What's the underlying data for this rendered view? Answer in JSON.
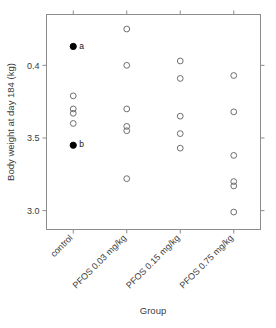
{
  "chart_data": {
    "type": "scatter",
    "title": "",
    "xlabel": "Group",
    "ylabel": "Body weight at day 184 (kg)",
    "categories": [
      "control",
      "PFOS 0.03 mg/kg",
      "PFOS 0.15 mg/kg",
      "PFOS 0.75 mg/kg"
    ],
    "ytick_labels": [
      "3.0",
      "3.5",
      "0.4"
    ],
    "ytick_values": [
      3.0,
      3.5,
      4.0
    ],
    "ylim": [
      2.87,
      4.35
    ],
    "grid": false,
    "legend": "none",
    "marker": "open-circle",
    "series": [
      {
        "name": "control",
        "category_index": 0,
        "points": [
          {
            "value": 4.13,
            "filled": true,
            "label": "a"
          },
          {
            "value": 3.79,
            "filled": false,
            "label": ""
          },
          {
            "value": 3.7,
            "filled": false,
            "label": ""
          },
          {
            "value": 3.67,
            "filled": false,
            "label": ""
          },
          {
            "value": 3.6,
            "filled": false,
            "label": ""
          },
          {
            "value": 3.45,
            "filled": true,
            "label": "b"
          }
        ]
      },
      {
        "name": "PFOS 0.03 mg/kg",
        "category_index": 1,
        "points": [
          {
            "value": 4.25,
            "filled": false,
            "label": ""
          },
          {
            "value": 4.0,
            "filled": false,
            "label": ""
          },
          {
            "value": 3.7,
            "filled": false,
            "label": ""
          },
          {
            "value": 3.58,
            "filled": false,
            "label": ""
          },
          {
            "value": 3.55,
            "filled": false,
            "label": ""
          },
          {
            "value": 3.22,
            "filled": false,
            "label": ""
          }
        ]
      },
      {
        "name": "PFOS 0.15 mg/kg",
        "category_index": 2,
        "points": [
          {
            "value": 4.03,
            "filled": false,
            "label": ""
          },
          {
            "value": 3.91,
            "filled": false,
            "label": ""
          },
          {
            "value": 3.65,
            "filled": false,
            "label": ""
          },
          {
            "value": 3.53,
            "filled": false,
            "label": ""
          },
          {
            "value": 3.43,
            "filled": false,
            "label": ""
          }
        ]
      },
      {
        "name": "PFOS 0.75 mg/kg",
        "category_index": 3,
        "points": [
          {
            "value": 3.93,
            "filled": false,
            "label": ""
          },
          {
            "value": 3.68,
            "filled": false,
            "label": ""
          },
          {
            "value": 3.38,
            "filled": false,
            "label": ""
          },
          {
            "value": 3.2,
            "filled": false,
            "label": ""
          },
          {
            "value": 3.17,
            "filled": false,
            "label": ""
          },
          {
            "value": 2.99,
            "filled": false,
            "label": ""
          }
        ]
      }
    ],
    "annotations": [
      {
        "label": "a",
        "group": "control",
        "value": 4.13
      },
      {
        "label": "b",
        "group": "control",
        "value": 3.45
      }
    ],
    "colors": {
      "frame": "#8c8c8c",
      "open_marker": "#6e6e6e",
      "filled_marker": "#000000",
      "text": "#3b3b3b",
      "background": "#ffffff"
    }
  }
}
